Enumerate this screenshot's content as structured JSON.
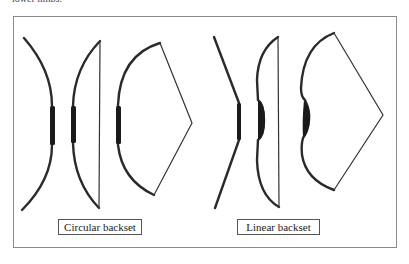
{
  "caption_fragment": "lower limbs.",
  "diagram": {
    "groups": [
      {
        "label": "Circular backset",
        "bows": [
          {
            "name": "unstrung",
            "state": "relaxed"
          },
          {
            "name": "braced",
            "state": "strung"
          },
          {
            "name": "drawn",
            "state": "full draw"
          }
        ]
      },
      {
        "label": "Linear backset",
        "bows": [
          {
            "name": "unstrung",
            "state": "relaxed"
          },
          {
            "name": "braced",
            "state": "strung"
          },
          {
            "name": "drawn",
            "state": "full draw"
          }
        ]
      }
    ],
    "colors": {
      "limb": "#2a2a2a",
      "grip": "#1a1a1a",
      "string": "#333333",
      "frame": "#8a8a8a"
    }
  }
}
